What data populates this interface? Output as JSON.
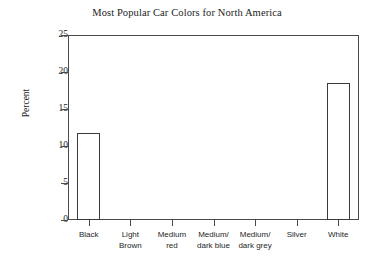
{
  "chart_data": {
    "type": "bar",
    "title": "Most Popular Car Colors for North America",
    "xlabel": "",
    "ylabel": "Percent",
    "ylim": [
      0,
      25
    ],
    "yticks": [
      0,
      5,
      10,
      15,
      20,
      25
    ],
    "grid": false,
    "legend": false,
    "bar_style": "unfilled-outline",
    "categories": [
      "Black",
      "Light Brown",
      "Medium red",
      "Medium/ dark blue",
      "Medium/ dark grey",
      "Silver",
      "White"
    ],
    "category_lines": [
      [
        "Black",
        ""
      ],
      [
        "Light",
        "Brown"
      ],
      [
        "Medium",
        "red"
      ],
      [
        "Medium/",
        "dark blue"
      ],
      [
        "Medium/",
        "dark grey"
      ],
      [
        "Silver",
        ""
      ],
      [
        "White",
        ""
      ]
    ],
    "values": [
      11.7,
      0,
      0,
      0,
      0,
      0,
      18.5
    ],
    "ytick_labels": [
      "0",
      "5",
      "10",
      "15",
      "20",
      "25"
    ]
  },
  "colors": {
    "background": "#ffffff",
    "axis": "#4a4a4a",
    "bar_outline": "#3a3a3a",
    "bar_fill": "#ffffff",
    "text": "#1b1b1b"
  }
}
